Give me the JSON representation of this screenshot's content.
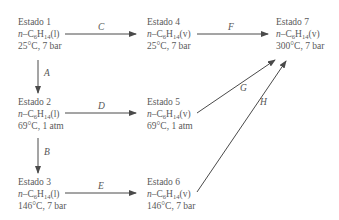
{
  "states": [
    {
      "id": "s1",
      "title": "Estado 1",
      "prefix": "n",
      "compound_base": "–C",
      "sub1": "6",
      "mid": "H",
      "sub2": "14",
      "phase": "(l)",
      "conditions": "25°C, 7 bar"
    },
    {
      "id": "s2",
      "title": "Estado 2",
      "prefix": "n",
      "compound_base": "–C",
      "sub1": "6",
      "mid": "H",
      "sub2": "14",
      "phase": "(l)",
      "conditions": "69°C, 1 atm"
    },
    {
      "id": "s3",
      "title": "Estado 3",
      "prefix": "n",
      "compound_base": "–C",
      "sub1": "6",
      "mid": "H",
      "sub2": "14",
      "phase": "(l)",
      "conditions": "146°C, 7 bar"
    },
    {
      "id": "s4",
      "title": "Estado 4",
      "prefix": "n",
      "compound_base": "–C",
      "sub1": "6",
      "mid": "H",
      "sub2": "14",
      "phase": "(v)",
      "conditions": "25°C, 7 bar"
    },
    {
      "id": "s5",
      "title": "Estado 5",
      "prefix": "n",
      "compound_base": "–C",
      "sub1": "6",
      "mid": "H",
      "sub2": "14",
      "phase": "(v)",
      "conditions": "69°C, 1 atm"
    },
    {
      "id": "s6",
      "title": "Estado 6",
      "prefix": "n",
      "compound_base": "–C",
      "sub1": "6",
      "mid": "H",
      "sub2": "14",
      "phase": "(v)",
      "conditions": "146°C, 7 bar"
    },
    {
      "id": "s7",
      "title": "Estado 7",
      "prefix": "n",
      "compound_base": "–C",
      "sub1": "6",
      "mid": "H",
      "sub2": "14",
      "phase": "(v)",
      "conditions": "300°C, 7 bar"
    }
  ],
  "paths": [
    {
      "label": "A",
      "from": "Estado 1",
      "to": "Estado 2"
    },
    {
      "label": "B",
      "from": "Estado 2",
      "to": "Estado 3"
    },
    {
      "label": "C",
      "from": "Estado 1",
      "to": "Estado 4"
    },
    {
      "label": "D",
      "from": "Estado 2",
      "to": "Estado 5"
    },
    {
      "label": "E",
      "from": "Estado 3",
      "to": "Estado 6"
    },
    {
      "label": "F",
      "from": "Estado 4",
      "to": "Estado 7"
    },
    {
      "label": "G",
      "from": "Estado 5",
      "to": "Estado 7"
    },
    {
      "label": "H",
      "from": "Estado 6",
      "to": "Estado 7"
    }
  ],
  "colors": {
    "line": "#4a4a4a",
    "text": "#5a5a5a"
  }
}
